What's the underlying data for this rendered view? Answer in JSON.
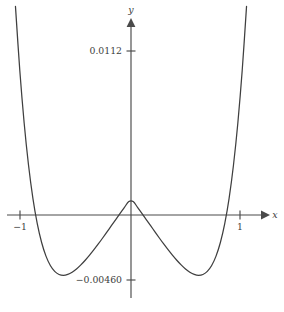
{
  "chart_data": {
    "type": "line",
    "title": "",
    "subtitle": "",
    "xlabel": "x",
    "ylabel": "y",
    "grid": false,
    "legend": null,
    "axis_style": "arrow-axes-centered-at-origin",
    "xlim": [
      -1.12,
      1.22
    ],
    "ylim": [
      -0.0056,
      0.0135
    ],
    "x_ticks": [
      -1,
      1
    ],
    "x_tick_labels": [
      "−1",
      "1"
    ],
    "y_ticks": [
      0.0112,
      -0.0046
    ],
    "y_tick_labels": [
      "0.0112",
      "−0.00460"
    ],
    "annotations": [],
    "series": [
      {
        "name": "f(x)",
        "expression": "quartic even polynomial with roots near ±0.37 and ±0.93",
        "roots": [
          -0.93,
          -0.37,
          0.37,
          0.93
        ],
        "local_maximum": {
          "x": 0,
          "y": 0.0028
        },
        "local_minima": [
          {
            "x": -0.66,
            "y": -0.0046
          },
          {
            "x": 0.66,
            "y": -0.0046
          }
        ],
        "x": [
          -1.06,
          -1.02,
          -0.98,
          -0.94,
          -0.9,
          -0.86,
          -0.82,
          -0.78,
          -0.74,
          -0.7,
          -0.66,
          -0.62,
          -0.58,
          -0.54,
          -0.5,
          -0.46,
          -0.42,
          -0.38,
          -0.34,
          -0.3,
          -0.26,
          -0.22,
          -0.18,
          -0.14,
          -0.1,
          -0.06,
          -0.02,
          0.02,
          0.06,
          0.1,
          0.14,
          0.18,
          0.22,
          0.26,
          0.3,
          0.34,
          0.38,
          0.42,
          0.46,
          0.5,
          0.54,
          0.58,
          0.62,
          0.66,
          0.7,
          0.74,
          0.78,
          0.82,
          0.86,
          0.9,
          0.94,
          0.98,
          1.02,
          1.06
        ],
        "y": [
          0.01425,
          0.00985,
          0.00627,
          0.0034,
          0.00114,
          -0.00059,
          -0.00188,
          -0.00281,
          -0.00345,
          -0.00385,
          -0.00406,
          -0.00412,
          -0.00406,
          -0.00391,
          -0.00369,
          -0.00341,
          -0.00309,
          -0.00274,
          -0.00237,
          -0.00198,
          -0.00157,
          -0.00115,
          -0.00073,
          -0.00031,
          0.00011,
          0.00052,
          0.00092,
          0.00092,
          0.00052,
          0.00011,
          -0.00031,
          -0.00073,
          -0.00115,
          -0.00157,
          -0.00198,
          -0.00237,
          -0.00274,
          -0.00309,
          -0.00341,
          -0.00369,
          -0.00391,
          -0.00406,
          -0.00412,
          -0.00406,
          -0.00385,
          -0.00345,
          -0.00281,
          -0.00188,
          -0.00059,
          0.00114,
          0.0034,
          0.00627,
          0.00985,
          0.01425
        ]
      }
    ]
  },
  "figure": {
    "y_axis_label": "y",
    "x_axis_label": "x",
    "tick_label_top": "0.0112",
    "tick_label_bottom": "−0.00460",
    "tick_label_left": "−1",
    "tick_label_right": "1",
    "curve_color": "#3f3f3f",
    "axis_color": "#4a4a4a",
    "background_color": "#ffffff"
  }
}
